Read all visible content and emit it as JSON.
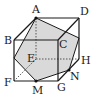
{
  "figure": {
    "type": "cube-cross-section",
    "vertices": {
      "A": {
        "label": "A",
        "x": 36,
        "y": 18
      },
      "B": {
        "label": "B",
        "x": 14,
        "y": 40
      },
      "C": {
        "label": "C",
        "x": 58,
        "y": 40
      },
      "D": {
        "label": "D",
        "x": 79,
        "y": 18
      },
      "E": {
        "label": "E",
        "x": 36,
        "y": 59
      },
      "F": {
        "label": "F",
        "x": 14,
        "y": 81
      },
      "G": {
        "label": "G",
        "x": 58,
        "y": 81
      },
      "H": {
        "label": "H",
        "x": 79,
        "y": 59
      },
      "M": {
        "label": "M",
        "x": 36,
        "y": 81
      },
      "N": {
        "label": "N",
        "x": 69,
        "y": 70
      }
    },
    "section_color": "#d9d9d9",
    "edge_color": "#1a1a1a"
  }
}
